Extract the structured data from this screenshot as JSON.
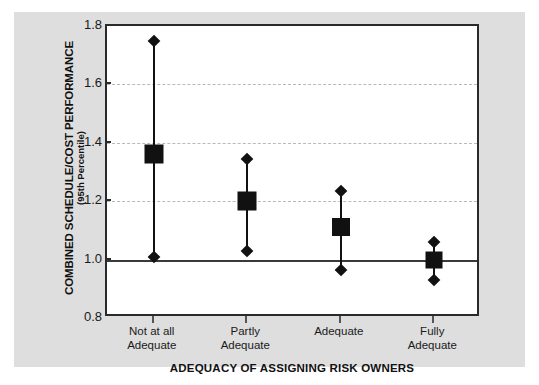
{
  "chart_data": {
    "type": "scatter",
    "title": "",
    "xlabel": "ADEQUACY OF ASSIGNING RISK OWNERS",
    "ylabel": "COMBINED SCHEDULE/COST PERFORMANCE",
    "ylabel_sub": "(95th Percentile)",
    "categories": [
      "Not at all Adequate",
      "Partly Adequate",
      "Adequate",
      "Fully Adequate"
    ],
    "category_lines": [
      [
        "Not at all",
        "Adequate"
      ],
      [
        "Partly",
        "Adequate"
      ],
      [
        "Adequate",
        ""
      ],
      [
        "Fully",
        "Adequate"
      ]
    ],
    "ylim": [
      0.8,
      1.8
    ],
    "yticks": [
      "0.8",
      "1.0",
      "1.2",
      "1.4",
      "1.6",
      "1.8"
    ],
    "ytick_values": [
      0.8,
      1.0,
      1.2,
      1.4,
      1.6,
      1.8
    ],
    "gridlines": [
      1.2,
      1.4,
      1.6
    ],
    "reference_line": 1.0,
    "grid": true,
    "legend": "none",
    "series": [
      {
        "name": "Combined schedule/cost performance",
        "marker": "square",
        "values": [
          1.36,
          1.2,
          1.11,
          1.0
        ],
        "upper": [
          1.75,
          1.345,
          1.235,
          1.06
        ],
        "lower": [
          1.01,
          1.03,
          0.965,
          0.93
        ]
      }
    ],
    "points": [
      {
        "category": "Not at all Adequate",
        "value": 1.36,
        "upper": 1.75,
        "lower": 1.01
      },
      {
        "category": "Partly Adequate",
        "value": 1.2,
        "upper": 1.345,
        "lower": 1.03
      },
      {
        "category": "Adequate",
        "value": 1.11,
        "upper": 1.235,
        "lower": 0.965
      },
      {
        "category": "Fully Adequate",
        "value": 1.0,
        "upper": 1.06,
        "lower": 0.93
      }
    ],
    "colors": {
      "marker": "#111111",
      "axis": "#2a2a2a",
      "grid": "#b9b9b9",
      "panel_background": "#dedede",
      "plot_background": "#ffffff"
    }
  }
}
